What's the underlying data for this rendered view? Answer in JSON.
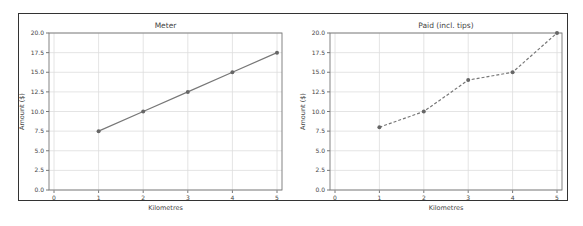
{
  "chart_data": [
    {
      "type": "line",
      "title": "Meter",
      "xlabel": "Kilometres",
      "ylabel": "Amount ($)",
      "x": [
        1,
        2,
        3,
        4,
        5
      ],
      "series": [
        {
          "name": "Meter",
          "values": [
            7.5,
            10.0,
            12.5,
            15.0,
            17.5
          ],
          "line_style": "solid",
          "marker": "circle",
          "color": "#777777"
        }
      ],
      "xlim": [
        0,
        5
      ],
      "ylim": [
        0,
        20
      ],
      "xticks": [
        "0",
        "1",
        "2",
        "3",
        "4",
        "5"
      ],
      "yticks": [
        "0.0",
        "2.5",
        "5.0",
        "7.5",
        "10.0",
        "12.5",
        "15.0",
        "17.5",
        "20.0"
      ],
      "grid": true,
      "legend": null
    },
    {
      "type": "line",
      "title": "Paid (incl. tips)",
      "xlabel": "Kilometres",
      "ylabel": "Amount ($)",
      "x": [
        1,
        2,
        3,
        4,
        5
      ],
      "series": [
        {
          "name": "Paid (incl. tips)",
          "values": [
            8.0,
            10.0,
            14.0,
            15.0,
            20.0
          ],
          "line_style": "dashed",
          "marker": "circle",
          "color": "#777777"
        }
      ],
      "xlim": [
        0,
        5
      ],
      "ylim": [
        0,
        20
      ],
      "xticks": [
        "0",
        "1",
        "2",
        "3",
        "4",
        "5"
      ],
      "yticks": [
        "0.0",
        "2.5",
        "5.0",
        "7.5",
        "10.0",
        "12.5",
        "15.0",
        "17.5",
        "20.0"
      ],
      "grid": true,
      "legend": null
    }
  ]
}
